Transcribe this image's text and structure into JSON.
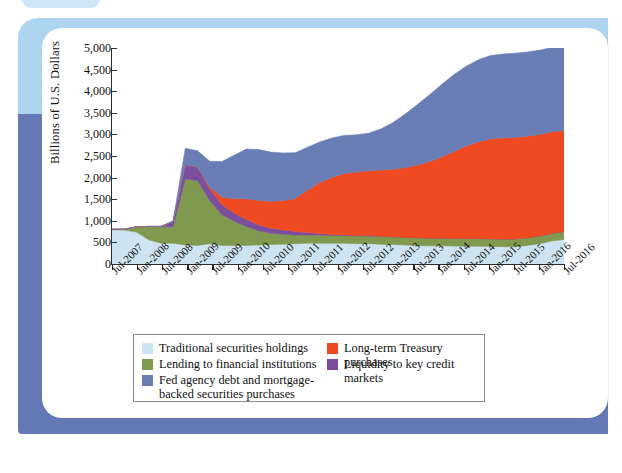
{
  "figure": {
    "ylabel": "Billions of U.S. Dollars",
    "yticks": [
      "0",
      "500",
      "1,000",
      "1,500",
      "2,000",
      "2,500",
      "3,000",
      "3,500",
      "4,000",
      "4,500",
      "5,000"
    ]
  },
  "legend": {
    "items": [
      {
        "label": "Traditional securities holdings",
        "color": "#cfe4f2",
        "col": 1,
        "row": 1
      },
      {
        "label": "Lending to financial institutions",
        "color": "#7f9a4e",
        "col": 1,
        "row": 2
      },
      {
        "label": "Fed agency debt and mortgage-\nbacked securities purchases",
        "color": "#6b7db5",
        "col": 1,
        "row": 3
      },
      {
        "label": "Long-term Treasury purchases",
        "color": "#f04a22",
        "col": 2,
        "row": 1
      },
      {
        "label": "Liquidity to key credit markets",
        "color": "#7c4f9e",
        "col": 2,
        "row": 2
      }
    ]
  },
  "chart_data": {
    "type": "area",
    "stacked": true,
    "title": "",
    "xlabel": "",
    "ylabel": "Billions of U.S. Dollars",
    "ylim": [
      0,
      5000
    ],
    "ytick_step": 500,
    "grid": false,
    "legend_position": "bottom",
    "xtick_labels": [
      "Jul-2007",
      "Jan-2008",
      "Jul-2008",
      "Jan-2009",
      "Jul-2009",
      "Jan-2010",
      "Jul-2010",
      "Jan-2011",
      "Jul-2011",
      "Jan-2012",
      "Jul-2012",
      "Jan-2013",
      "Jul-2013",
      "Jan-2014",
      "Jul-2014",
      "Jan-2015",
      "Jul-2015",
      "Jan-2016",
      "Jul-2016"
    ],
    "x": [
      "2007-07",
      "2007-10",
      "2008-01",
      "2008-04",
      "2008-07",
      "2008-10",
      "2008-12",
      "2009-01",
      "2009-04",
      "2009-07",
      "2009-10",
      "2010-01",
      "2010-04",
      "2010-07",
      "2010-10",
      "2011-01",
      "2011-04",
      "2011-07",
      "2011-10",
      "2012-01",
      "2012-04",
      "2012-07",
      "2012-10",
      "2013-01",
      "2013-04",
      "2013-07",
      "2013-10",
      "2014-01",
      "2014-04",
      "2014-07",
      "2014-10",
      "2015-01",
      "2015-04",
      "2015-07",
      "2015-10",
      "2016-01",
      "2016-04",
      "2016-07"
    ],
    "series": [
      {
        "name": "Traditional securities holdings",
        "color": "#cfe4f2",
        "values": [
          790,
          785,
          740,
          560,
          480,
          480,
          440,
          430,
          470,
          430,
          430,
          430,
          440,
          450,
          460,
          470,
          480,
          480,
          480,
          480,
          470,
          470,
          460,
          450,
          440,
          430,
          420,
          420,
          415,
          410,
          410,
          405,
          400,
          400,
          430,
          470,
          530,
          570
        ]
      },
      {
        "name": "Lending to financial institutions",
        "color": "#7f9a4e",
        "values": [
          15,
          20,
          120,
          310,
          380,
          380,
          1530,
          1500,
          1000,
          710,
          560,
          440,
          330,
          260,
          230,
          200,
          190,
          185,
          180,
          180,
          180,
          180,
          180,
          180,
          180,
          180,
          180,
          180,
          180,
          180,
          180,
          180,
          180,
          180,
          180,
          180,
          180,
          180
        ]
      },
      {
        "name": "Liquidity to key credit markets",
        "color": "#7c4f9e",
        "values": [
          0,
          0,
          0,
          0,
          10,
          120,
          330,
          310,
          270,
          230,
          190,
          160,
          140,
          120,
          100,
          85,
          60,
          40,
          25,
          15,
          10,
          8,
          5,
          3,
          2,
          0,
          0,
          0,
          0,
          0,
          0,
          0,
          0,
          0,
          0,
          0,
          0,
          0
        ]
      },
      {
        "name": "Long-term Treasury purchases",
        "color": "#f04a22",
        "values": [
          0,
          0,
          0,
          0,
          0,
          0,
          0,
          0,
          40,
          180,
          330,
          480,
          560,
          620,
          680,
          760,
          980,
          1180,
          1320,
          1420,
          1470,
          1500,
          1530,
          1560,
          1610,
          1680,
          1770,
          1880,
          2010,
          2140,
          2240,
          2310,
          2340,
          2350,
          2350,
          2350,
          2350,
          2340
        ]
      },
      {
        "name": "Fed agency debt and mortgage-backed securities purchases",
        "color": "#6b7db5",
        "values": [
          0,
          0,
          0,
          0,
          0,
          20,
          380,
          380,
          600,
          820,
          1010,
          1150,
          1180,
          1140,
          1100,
          1060,
          990,
          940,
          910,
          880,
          860,
          870,
          950,
          1080,
          1240,
          1400,
          1550,
          1680,
          1780,
          1850,
          1900,
          1930,
          1940,
          1950,
          1950,
          1950,
          1950,
          1950
        ]
      }
    ],
    "notes": {
      "peak_total_2009": 2250,
      "plateau_total_2015_2016": 4500
    }
  }
}
